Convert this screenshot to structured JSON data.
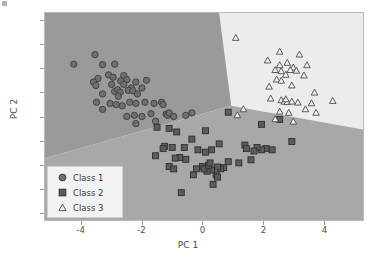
{
  "chart_data": {
    "type": "scatter",
    "title": "",
    "xlabel": "PC 1",
    "ylabel": "PC 2",
    "xlim": [
      -5.2,
      5.3
    ],
    "ylim": [
      -4.35,
      4.35
    ],
    "xticks": [
      -4,
      -2,
      0,
      2,
      4
    ],
    "yticks": [
      4,
      3,
      2,
      1,
      0,
      -1,
      -2,
      -3,
      -4
    ],
    "xtick_labels": [
      "-4",
      "-2",
      "0",
      "2",
      "4"
    ],
    "ytick_labels": [
      "4",
      "3",
      "2",
      "1",
      "0",
      "-1",
      "-2",
      "-3",
      "-4"
    ],
    "grid": false,
    "legend_position": "lower left",
    "background": "decision-regions",
    "decision_regions": [
      {
        "name": "Class 1 region",
        "color": "#9a9a9a",
        "label": "class-1-region"
      },
      {
        "name": "Class 2 region",
        "color": "#a8a8a8",
        "label": "class-2-region"
      },
      {
        "name": "Class 3 region",
        "color": "#ececec",
        "label": "class-3-region"
      }
    ],
    "series": [
      {
        "name": "Class 1",
        "marker": "circle",
        "color": "#6f6f6f",
        "edge_color": "#3d3d3d",
        "points": [
          [
            -4.25,
            2.2
          ],
          [
            -3.55,
            2.6
          ],
          [
            -3.3,
            2.18
          ],
          [
            -2.9,
            2.2
          ],
          [
            -3.45,
            1.6
          ],
          [
            -3.6,
            1.45
          ],
          [
            -3.52,
            1.3
          ],
          [
            -3.1,
            1.75
          ],
          [
            -2.95,
            1.65
          ],
          [
            -2.7,
            1.5
          ],
          [
            -2.6,
            1.72
          ],
          [
            -2.5,
            1.55
          ],
          [
            -2.35,
            1.2
          ],
          [
            -2.9,
            1.05
          ],
          [
            -2.8,
            1.12
          ],
          [
            -2.72,
            1.02
          ],
          [
            -2.45,
            1.1
          ],
          [
            -2.3,
            1.08
          ],
          [
            -3.3,
            0.95
          ],
          [
            -3.5,
            0.6
          ],
          [
            -3.3,
            0.3
          ],
          [
            -3.05,
            0.55
          ],
          [
            -2.85,
            0.5
          ],
          [
            -2.65,
            0.45
          ],
          [
            -2.4,
            0.6
          ],
          [
            -2.2,
            0.55
          ],
          [
            -2.15,
            0.95
          ],
          [
            -2.0,
            1.2
          ],
          [
            -1.9,
            0.6
          ],
          [
            -2.0,
            0.0
          ],
          [
            -2.25,
            0.05
          ],
          [
            -2.5,
            0.0
          ],
          [
            -1.6,
            0.55
          ],
          [
            -1.35,
            0.6
          ],
          [
            -1.3,
            0.5
          ],
          [
            -1.2,
            0.1
          ],
          [
            -1.15,
            0.05
          ],
          [
            -1.1,
            0.15
          ],
          [
            -0.95,
            0.0
          ],
          [
            -0.55,
            0.05
          ],
          [
            -0.35,
            0.15
          ],
          [
            -1.55,
            -0.2
          ],
          [
            -2.2,
            -0.3
          ],
          [
            -1.7,
            0.12
          ],
          [
            -2.6,
            1.35
          ],
          [
            -3.0,
            1.35
          ],
          [
            -2.78,
            0.85
          ],
          [
            -2.2,
            1.45
          ],
          [
            -1.85,
            1.52
          ]
        ]
      },
      {
        "name": "Class 2",
        "marker": "square",
        "color": "#5c5c5c",
        "edge_color": "#2e2e2e",
        "points": [
          [
            -1.5,
            -0.45
          ],
          [
            -1.1,
            -0.5
          ],
          [
            -0.85,
            -0.65
          ],
          [
            -0.35,
            -0.95
          ],
          [
            0.1,
            -0.6
          ],
          [
            0.55,
            -1.15
          ],
          [
            0.85,
            0.18
          ],
          [
            1.4,
            -1.2
          ],
          [
            1.95,
            -0.33
          ],
          [
            2.55,
            -0.12
          ],
          [
            2.95,
            -1.05
          ],
          [
            2.1,
            -1.35
          ],
          [
            1.95,
            -1.4
          ],
          [
            1.8,
            -1.3
          ],
          [
            1.7,
            -1.45
          ],
          [
            1.6,
            -1.82
          ],
          [
            1.2,
            -1.95
          ],
          [
            0.85,
            -1.9
          ],
          [
            0.7,
            -2.15
          ],
          [
            0.6,
            -2.2
          ],
          [
            0.5,
            -2.12
          ],
          [
            0.45,
            -2.45
          ],
          [
            0.5,
            -2.55
          ],
          [
            0.35,
            -2.85
          ],
          [
            0.3,
            -2.25
          ],
          [
            0.15,
            -2.3
          ],
          [
            0.0,
            -2.1
          ],
          [
            -0.3,
            -2.45
          ],
          [
            -0.55,
            -1.8
          ],
          [
            -0.75,
            -1.72
          ],
          [
            -0.9,
            -1.75
          ],
          [
            -1.1,
            -2.1
          ],
          [
            -1.25,
            -1.25
          ],
          [
            -1.3,
            -1.35
          ],
          [
            -1.55,
            -1.65
          ],
          [
            -0.6,
            -1.3
          ],
          [
            -0.95,
            -2.2
          ],
          [
            -0.7,
            -3.2
          ],
          [
            -0.15,
            -1.4
          ],
          [
            0.1,
            -1.5
          ],
          [
            0.3,
            -1.4
          ],
          [
            -0.2,
            -2.2
          ],
          [
            0.05,
            -2.2
          ],
          [
            0.2,
            -2.05
          ],
          [
            0.25,
            -1.95
          ],
          [
            2.3,
            -1.4
          ],
          [
            1.45,
            -1.35
          ],
          [
            -1.0,
            -1.3
          ]
        ]
      },
      {
        "name": "Class 3",
        "marker": "triangle",
        "color": "#f0f0f0",
        "edge_color": "#4a4a4a",
        "points": [
          [
            1.1,
            3.3
          ],
          [
            2.55,
            2.72
          ],
          [
            3.2,
            2.6
          ],
          [
            2.15,
            2.35
          ],
          [
            2.55,
            2.15
          ],
          [
            2.8,
            2.25
          ],
          [
            3.0,
            2.05
          ],
          [
            3.45,
            2.15
          ],
          [
            2.4,
            1.95
          ],
          [
            2.6,
            1.9
          ],
          [
            2.9,
            1.95
          ],
          [
            3.1,
            1.92
          ],
          [
            2.75,
            1.75
          ],
          [
            3.35,
            1.72
          ],
          [
            2.45,
            1.55
          ],
          [
            2.6,
            1.5
          ],
          [
            2.2,
            1.25
          ],
          [
            2.95,
            1.3
          ],
          [
            3.7,
            1.0
          ],
          [
            2.25,
            0.75
          ],
          [
            2.6,
            0.68
          ],
          [
            2.7,
            0.62
          ],
          [
            2.8,
            0.6
          ],
          [
            2.95,
            0.62
          ],
          [
            3.15,
            0.58
          ],
          [
            3.6,
            0.55
          ],
          [
            4.3,
            0.65
          ],
          [
            3.75,
            0.15
          ],
          [
            2.55,
            0.2
          ],
          [
            1.35,
            0.3
          ],
          [
            2.4,
            -0.12
          ],
          [
            3.0,
            -0.22
          ],
          [
            2.75,
            0.72
          ],
          [
            2.85,
            0.15
          ],
          [
            1.15,
            0.05
          ],
          [
            3.4,
            0.3
          ]
        ]
      }
    ]
  },
  "legend": {
    "entries": [
      {
        "label": "Class 1",
        "marker": "circle-marker"
      },
      {
        "label": "Class 2",
        "marker": "square-marker"
      },
      {
        "label": "Class 3",
        "marker": "triangle-marker"
      }
    ]
  },
  "axes": {
    "xlabel": "PC 1",
    "ylabel": "PC 2"
  },
  "colors": {
    "region_class1": "#9a9a9a",
    "region_class2": "#a8a8a8",
    "region_class3": "#ececec",
    "marker_class1": "#6f6f6f",
    "marker_class2": "#5c5c5c",
    "marker_class3": "#f0f0f0",
    "tick_text": "#4a4a4a"
  }
}
